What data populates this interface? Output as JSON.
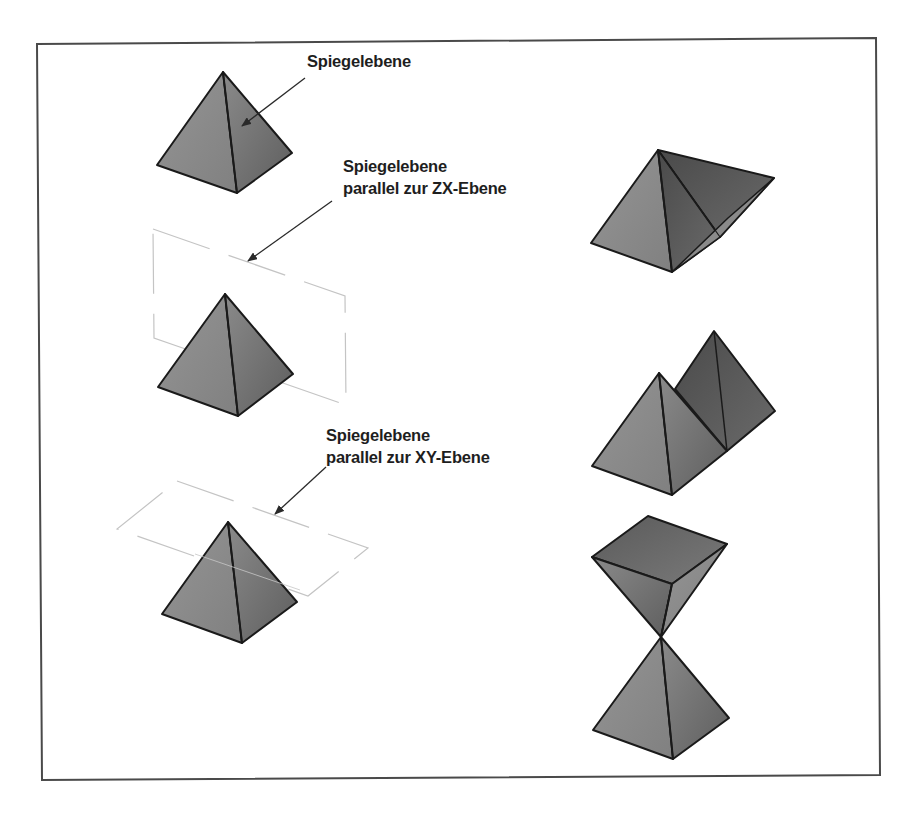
{
  "figure": {
    "frame": {
      "points": "37,44 876,38 880,775 42,780",
      "stroke": "#444444"
    },
    "colors": {
      "edge": "#1a1a1a",
      "face_light": "#8c8c8c",
      "face_mid": "#7a7a7a",
      "face_dark": "#555555",
      "face_darker": "#4a4a4a",
      "plane_line": "#c8c8c8",
      "arrow": "#2a2a2a"
    },
    "labels": [
      {
        "id": "label-mirror-plane",
        "lines": [
          "Spiegelebene"
        ],
        "x": 307,
        "y": 50
      },
      {
        "id": "label-mirror-plane-zx",
        "lines": [
          "Spiegelebene",
          "parallel zur ZX-Ebene"
        ],
        "x": 343,
        "y": 155
      },
      {
        "id": "label-mirror-plane-xy",
        "lines": [
          "Spiegelebene",
          "parallel zur XY-Ebene"
        ],
        "x": 326,
        "y": 424
      }
    ],
    "left_column": [
      {
        "id": "pyramid-original",
        "apex": [
          223,
          72
        ],
        "left": [
          157,
          165
        ],
        "front": [
          237,
          193
        ],
        "right": [
          292,
          153
        ]
      },
      {
        "id": "pyramid-zx-plane",
        "apex": [
          225,
          294
        ],
        "left": [
          158,
          387
        ],
        "front": [
          238,
          416
        ],
        "right": [
          293,
          374
        ]
      },
      {
        "id": "pyramid-xy-plane",
        "apex": [
          228,
          522
        ],
        "left": [
          162,
          614
        ],
        "front": [
          242,
          643
        ],
        "right": [
          297,
          602
        ]
      }
    ],
    "planes": [
      {
        "id": "plane-zx",
        "points": "153,229 345,296 346,405 154,338"
      },
      {
        "id": "plane-xy",
        "points": "177,481 368,548 308,596 117,529"
      }
    ],
    "arrows": [
      {
        "id": "arrow-mirror-plane",
        "from": [
          305,
          78
        ],
        "to": [
          242,
          126
        ]
      },
      {
        "id": "arrow-zx",
        "from": [
          332,
          201
        ],
        "to": [
          248,
          261
        ]
      },
      {
        "id": "arrow-xy",
        "from": [
          326,
          467
        ],
        "to": [
          275,
          514
        ]
      }
    ],
    "right_column": [
      {
        "id": "result-inclined-mirror"
      },
      {
        "id": "result-zx-mirror"
      },
      {
        "id": "result-xy-mirror"
      }
    ]
  }
}
